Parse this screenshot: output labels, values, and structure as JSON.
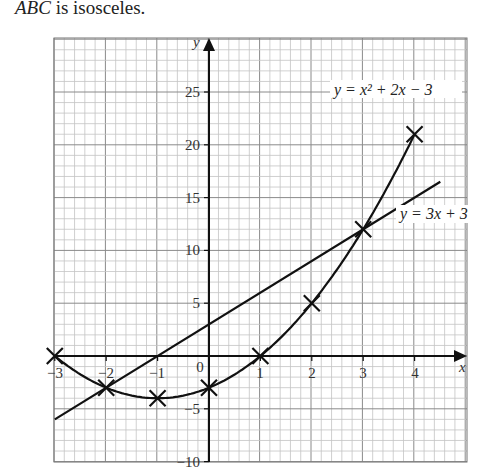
{
  "caption": {
    "italic": "ABC",
    "text": " is isosceles."
  },
  "chart_data": {
    "type": "line",
    "title": "",
    "xlabel": "x",
    "ylabel": "y",
    "xlim": [
      -3,
      4.5
    ],
    "ylim": [
      -10,
      28
    ],
    "x_ticks": [
      "−3",
      "−2",
      "−1",
      "0",
      "1",
      "2",
      "3",
      "4"
    ],
    "y_ticks": [
      "−10",
      "−5",
      "5",
      "10",
      "15",
      "20",
      "25"
    ],
    "grid": true,
    "series": [
      {
        "name": "y = x² + 2x − 3",
        "type": "curve",
        "points": [
          [
            -3,
            0
          ],
          [
            -2,
            -3
          ],
          [
            -1,
            -4
          ],
          [
            0,
            -3
          ],
          [
            1,
            0
          ],
          [
            2,
            5
          ],
          [
            3,
            12
          ],
          [
            4,
            21
          ]
        ],
        "markers": "cross"
      },
      {
        "name": "y = 3x + 3",
        "type": "line",
        "points": [
          [
            -3,
            -6
          ],
          [
            4.5,
            16.5
          ]
        ]
      }
    ],
    "annotations": [
      {
        "text": "y = x² + 2x − 3",
        "near": [
          3.6,
          23
        ]
      },
      {
        "text": "y = 3x + 3",
        "near": [
          4.3,
          13
        ]
      }
    ]
  },
  "labels": {
    "x_axis": "x",
    "y_axis": "y",
    "origin": "0",
    "xt": [
      "−3",
      "−2",
      "−1",
      "1",
      "2",
      "3",
      "4"
    ],
    "yt": [
      "25",
      "20",
      "15",
      "10",
      "5",
      "−5",
      "−10"
    ],
    "eq1": "y = x² + 2x − 3",
    "eq2": "y = 3x + 3"
  }
}
